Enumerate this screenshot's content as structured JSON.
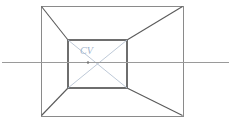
{
  "figure": {
    "canvas": {
      "width": 233,
      "height": 127
    },
    "background_color": "#ffffff"
  },
  "labels": {
    "center_of_vision": "CV"
  },
  "colors": {
    "outer_rect_stroke": "#8a8a8a",
    "inner_rect_stroke": "#6e6e6e",
    "orthogonal_stroke": "#5a5a5a",
    "horizon_stroke": "#9a9a9a",
    "diagonal_stroke": "#b7c3d2",
    "cv_label": "#9fb4cd"
  },
  "geometry": {
    "outer_rect": {
      "x1": 41,
      "y1": 6,
      "x2": 183,
      "y2": 116
    },
    "inner_rect": {
      "x1": 68,
      "y1": 40,
      "x2": 127,
      "y2": 88
    },
    "vanishing_point": {
      "x": 88,
      "y": 62
    },
    "horizon_line": {
      "x1": 2,
      "y1": 62,
      "x2": 229,
      "y2": 62
    },
    "orthogonals": [
      {
        "from": [
          41,
          6
        ],
        "to": [
          68,
          40
        ]
      },
      {
        "from": [
          183,
          7
        ],
        "to": [
          127,
          40
        ]
      },
      {
        "from": [
          41,
          116
        ],
        "to": [
          68,
          88
        ]
      },
      {
        "from": [
          183,
          116
        ],
        "to": [
          127,
          88
        ]
      }
    ],
    "diagonals": [
      {
        "from": [
          68,
          40
        ],
        "to": [
          127,
          88
        ]
      },
      {
        "from": [
          127,
          40
        ],
        "to": [
          68,
          88
        ]
      }
    ],
    "cv_label_pos": {
      "x": 80,
      "y": 54
    }
  }
}
